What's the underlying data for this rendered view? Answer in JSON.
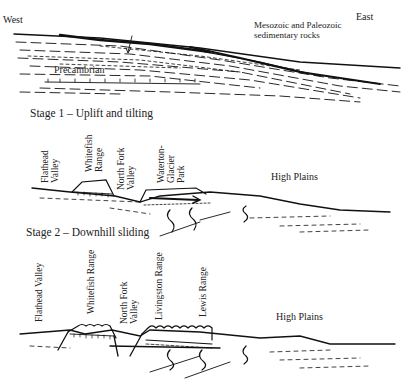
{
  "panel0": {
    "west_label": "West",
    "east_label": "East",
    "strata_label_line1": "Mesozoic and Paleozoic",
    "strata_label_line2": "sedimentary rocks",
    "basement_label": "Precambrian"
  },
  "stage1": {
    "title": "Stage 1 – Uplift and tilting",
    "labels": {
      "flathead_line1": "Flathead",
      "flathead_line2": "Valley",
      "whitefish_line1": "Whitefish",
      "whitefish_line2": "Range",
      "northfork_line1": "North Fork",
      "northfork_line2": "Valley",
      "waterton_line1": "Waterton-",
      "waterton_line2": "Glacier",
      "waterton_line3": "Park",
      "high_plains": "High Plains"
    }
  },
  "stage2": {
    "title": "Stage 2 – Downhill sliding",
    "labels": {
      "flathead": "Flathead Valley",
      "whitefish": "Whitefish Range",
      "northfork_line1": "North Fork",
      "northfork_line2": "Valley",
      "livingston": "Livingston Range",
      "lewis": "Lewis Range",
      "high_plains": "High Plains"
    }
  }
}
